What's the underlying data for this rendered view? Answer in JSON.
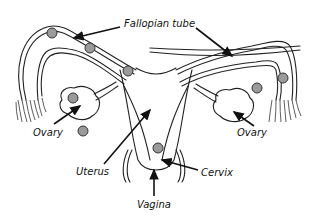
{
  "diagram": {
    "labels": {
      "fallopian_tube": "Fallopian tube",
      "ovary_left": "Ovary",
      "ovary_right": "Ovary",
      "uterus": "Uterus",
      "cervix": "Cervix",
      "vagina": "Vagina"
    },
    "colors": {
      "line": "#222222",
      "egg_fill": "#9a9a9a",
      "background": "#ffffff"
    },
    "egg_count": 8
  }
}
